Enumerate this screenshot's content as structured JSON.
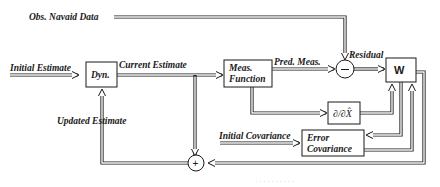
{
  "diagram": {
    "inputs": {
      "obs_navaid": "Obs. Navaid Data",
      "initial_estimate": "Initial Estimate",
      "initial_covariance": "Initial Covariance"
    },
    "blocks": {
      "dynamics": "Dyn.",
      "meas_function_line1": "Meas.",
      "meas_function_line2": "Function",
      "weight": "W",
      "partial_derivative": "∂/∂X̂",
      "error_cov_line1": "Error",
      "error_cov_line2": "Covariance"
    },
    "summing_junctions": {
      "difference": "−",
      "sum": "+"
    },
    "signals": {
      "current_estimate": "Current Estimate",
      "pred_meas": "Pred. Meas.",
      "residual": "Residual",
      "updated_estimate": "Updated Estimate"
    },
    "caption": "· · · · · · · · · ·"
  }
}
